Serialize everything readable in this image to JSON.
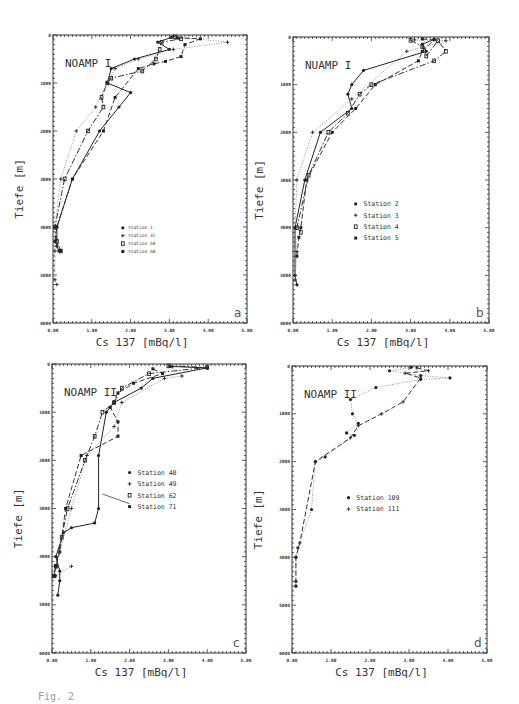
{
  "figure": {
    "caption": "Fig. 2",
    "y_axis_title": "Tiefe   [m]",
    "x_axis_title": "Cs 137    [mBq/l]"
  },
  "chart_data": [
    {
      "type": "line",
      "panel": "a",
      "title": "NOAMP I",
      "xlabel": "Cs 137 [mBq/l]",
      "ylabel": "Tiefe [m]",
      "xlim": [
        0,
        5
      ],
      "ylim": [
        6000,
        0
      ],
      "x_ticks": [
        "0.00",
        "1.00",
        "2.00",
        "3.00",
        "4.00",
        "5.00"
      ],
      "y_ticks": [
        "0",
        "1000",
        "2000",
        "3000",
        "4000",
        "5000",
        "6000"
      ],
      "grid": false,
      "legend_position": "center",
      "legend_font": 4.5,
      "box": {
        "x0": 53,
        "x1": 247,
        "y0": 35,
        "y1": 323
      },
      "series": [
        {
          "name": "Station 1",
          "marker": "*",
          "style": "solid",
          "points": [
            [
              3.05,
              50
            ],
            [
              2.7,
              150
            ],
            [
              3.0,
              300
            ],
            [
              2.1,
              500
            ],
            [
              1.5,
              700
            ],
            [
              1.4,
              1000
            ],
            [
              2.0,
              1200
            ],
            [
              1.7,
              1500
            ],
            [
              1.2,
              2000
            ],
            [
              0.5,
              3000
            ],
            [
              0.1,
              4000
            ],
            [
              0.1,
              4400
            ],
            [
              0.15,
              4500
            ]
          ]
        },
        {
          "name": "Station 31",
          "marker": "+",
          "style": "dotted",
          "points": [
            [
              3.1,
              30
            ],
            [
              4.5,
              150
            ],
            [
              3.1,
              300
            ],
            [
              2.2,
              500
            ],
            [
              1.6,
              700
            ],
            [
              1.4,
              1000
            ],
            [
              1.1,
              1500
            ],
            [
              0.6,
              2000
            ],
            [
              0.2,
              3000
            ],
            [
              0.05,
              4000
            ],
            [
              0.05,
              4500
            ],
            [
              0.05,
              5100
            ],
            [
              0.1,
              5200
            ]
          ]
        },
        {
          "name": "Station 54",
          "marker": "O",
          "style": "dash-dot",
          "points": [
            [
              3.15,
              40
            ],
            [
              3.3,
              80
            ],
            [
              2.8,
              150
            ],
            [
              2.75,
              300
            ],
            [
              2.65,
              500
            ],
            [
              2.3,
              750
            ],
            [
              1.5,
              900
            ],
            [
              1.4,
              1000
            ],
            [
              1.25,
              1300
            ],
            [
              1.3,
              1500
            ],
            [
              0.9,
              2000
            ],
            [
              0.3,
              3000
            ],
            [
              0.05,
              4000
            ],
            [
              0.1,
              4300
            ],
            [
              0.2,
              4500
            ]
          ]
        },
        {
          "name": "Station 58",
          "marker": "x",
          "style": "dashed",
          "points": [
            [
              3.2,
              60
            ],
            [
              3.8,
              80
            ],
            [
              3.4,
              200
            ],
            [
              3.3,
              450
            ],
            [
              2.9,
              550
            ],
            [
              2.6,
              600
            ],
            [
              2.2,
              700
            ],
            [
              1.6,
              1300
            ],
            [
              1.3,
              2000
            ],
            [
              0.5,
              3000
            ],
            [
              0.1,
              4000
            ],
            [
              0.05,
              4300
            ],
            [
              0.2,
              4500
            ]
          ]
        }
      ]
    },
    {
      "type": "line",
      "panel": "b",
      "title": "NUAMP I",
      "xlabel": "Cs 137 [mBq/l]",
      "ylabel": "Tiefe [m]",
      "xlim": [
        0,
        5
      ],
      "ylim": [
        6000,
        0
      ],
      "x_ticks": [
        "0.00",
        "1.00",
        "2.00",
        "3.00",
        "4.00",
        "5.00"
      ],
      "y_ticks": [
        "0",
        "1000",
        "2000",
        "3000",
        "4000",
        "5000",
        "6000"
      ],
      "grid": false,
      "legend_position": "center",
      "legend_font": 6.5,
      "box": {
        "x0": 293,
        "x1": 489,
        "y0": 37,
        "y1": 323
      },
      "series": [
        {
          "name": "Station 2",
          "marker": "*",
          "style": "solid",
          "points": [
            [
              3.6,
              50
            ],
            [
              3.3,
              150
            ],
            [
              3.4,
              300
            ],
            [
              1.8,
              700
            ],
            [
              1.5,
              1000
            ],
            [
              1.4,
              1200
            ],
            [
              1.5,
              1500
            ],
            [
              0.7,
              2000
            ],
            [
              0.3,
              3000
            ],
            [
              0.05,
              4000
            ],
            [
              0.05,
              5000
            ],
            [
              0.1,
              5200
            ]
          ]
        },
        {
          "name": "Station 3",
          "marker": "+",
          "style": "dotted",
          "points": [
            [
              3.1,
              60
            ],
            [
              3.9,
              80
            ],
            [
              2.9,
              300
            ],
            [
              1.5,
              1300
            ],
            [
              0.5,
              2000
            ],
            [
              0.1,
              3000
            ],
            [
              0.05,
              4000
            ],
            [
              0.1,
              4500
            ],
            [
              0.05,
              5100
            ]
          ]
        },
        {
          "name": "Station 4",
          "marker": "O",
          "style": "dash-dot",
          "points": [
            [
              3.0,
              70
            ],
            [
              3.3,
              200
            ],
            [
              3.4,
              400
            ],
            [
              3.7,
              80
            ],
            [
              3.9,
              300
            ],
            [
              3.6,
              500
            ],
            [
              2.0,
              1000
            ],
            [
              1.7,
              1200
            ],
            [
              1.4,
              1600
            ],
            [
              0.9,
              2000
            ],
            [
              0.4,
              2900
            ],
            [
              0.1,
              4000
            ],
            [
              0.2,
              4100
            ]
          ]
        },
        {
          "name": "Station 5",
          "marker": "x",
          "style": "dashed",
          "points": [
            [
              3.3,
              40
            ],
            [
              3.6,
              60
            ],
            [
              3.3,
              300
            ],
            [
              3.2,
              500
            ],
            [
              2.1,
              1000
            ],
            [
              1.6,
              1500
            ],
            [
              1.0,
              2000
            ],
            [
              0.35,
              3000
            ],
            [
              0.2,
              4000
            ],
            [
              0.15,
              4200
            ],
            [
              0.1,
              4600
            ]
          ]
        }
      ]
    },
    {
      "type": "line",
      "panel": "c",
      "title": "NOAMP II",
      "xlabel": "Cs 137 [mBq/l]",
      "ylabel": "Tiefe [m]",
      "xlim": [
        0,
        5
      ],
      "ylim": [
        6000,
        0
      ],
      "x_ticks": [
        "0.00",
        "1.00",
        "2.00",
        "3.00",
        "4.00",
        "5.00"
      ],
      "y_ticks": [
        "0",
        "1000",
        "2000",
        "3000",
        "4000",
        "5000",
        "6000"
      ],
      "grid": false,
      "legend_position": "center-right",
      "legend_font": 6.5,
      "box": {
        "x0": 52,
        "x1": 246,
        "y0": 364,
        "y1": 653
      },
      "annotation": {
        "text": "arrow pointing to Station 71 profile",
        "from": [
          2.0,
          2900
        ],
        "to": [
          1.25,
          2700
        ]
      },
      "series": [
        {
          "name": "Station 40",
          "marker": "*",
          "style": "solid",
          "points": [
            [
              3.05,
              50
            ],
            [
              4.0,
              80
            ],
            [
              2.6,
              300
            ],
            [
              2.3,
              500
            ],
            [
              1.6,
              800
            ],
            [
              1.4,
              1000
            ],
            [
              1.2,
              1900
            ],
            [
              1.2,
              3000
            ],
            [
              1.1,
              3300
            ],
            [
              0.5,
              3400
            ],
            [
              0.3,
              3500
            ],
            [
              0.1,
              4000
            ],
            [
              0.2,
              4300
            ],
            [
              0.2,
              4500
            ],
            [
              0.15,
              4800
            ]
          ]
        },
        {
          "name": "Station 49",
          "marker": "+",
          "style": "dotted",
          "points": [
            [
              3.1,
              60
            ],
            [
              3.35,
              250
            ],
            [
              2.9,
              300
            ],
            [
              1.8,
              800
            ],
            [
              1.6,
              1300
            ],
            [
              0.9,
              1900
            ],
            [
              0.5,
              3000
            ],
            [
              0.1,
              4200
            ],
            [
              0.1,
              4400
            ],
            [
              0.5,
              4200
            ]
          ]
        },
        {
          "name": "Station 62",
          "marker": "O",
          "style": "dash-dot",
          "points": [
            [
              3.0,
              40
            ],
            [
              4.0,
              70
            ],
            [
              2.5,
              200
            ],
            [
              1.8,
              500
            ],
            [
              1.6,
              800
            ],
            [
              1.3,
              1000
            ],
            [
              1.1,
              1500
            ],
            [
              0.85,
              2000
            ],
            [
              0.4,
              3000
            ],
            [
              0.25,
              3600
            ],
            [
              0.1,
              4200
            ],
            [
              0.05,
              4400
            ]
          ]
        },
        {
          "name": "Station 71",
          "marker": "x",
          "style": "dashed",
          "points": [
            [
              2.6,
              100
            ],
            [
              2.85,
              200
            ],
            [
              2.1,
              400
            ],
            [
              1.7,
              600
            ],
            [
              1.5,
              900
            ],
            [
              1.7,
              1200
            ],
            [
              1.7,
              1500
            ],
            [
              0.75,
              1900
            ],
            [
              0.35,
              3000
            ],
            [
              0.2,
              3900
            ],
            [
              0.1,
              4200
            ],
            [
              0.05,
              4400
            ]
          ]
        }
      ]
    },
    {
      "type": "line",
      "panel": "d",
      "title": "NOAMP II",
      "xlabel": "Cs 137 [mBq/l]",
      "ylabel": "Tiefe [m]",
      "xlim": [
        0,
        5
      ],
      "ylim": [
        6000,
        0
      ],
      "x_ticks": [
        "0.00",
        "1.00",
        "2.00",
        "3.00",
        "4.00",
        "5.00"
      ],
      "y_ticks": [
        "0",
        "1000",
        "2000",
        "3000",
        "4000",
        "5000",
        "6000"
      ],
      "grid": false,
      "legend_position": "center",
      "legend_font": 6.5,
      "box": {
        "x0": 292,
        "x1": 487,
        "y0": 366,
        "y1": 653
      },
      "series": [
        {
          "name": "Station 109",
          "marker": "*",
          "style": "dotted",
          "points": [
            [
              3.05,
              30
            ],
            [
              2.5,
              100
            ],
            [
              3.3,
              200
            ],
            [
              4.05,
              250
            ],
            [
              3.3,
              280
            ],
            [
              2.15,
              450
            ],
            [
              1.5,
              700
            ],
            [
              1.55,
              1000
            ],
            [
              1.7,
              1200
            ],
            [
              1.4,
              1400
            ],
            [
              1.6,
              1450
            ],
            [
              0.85,
              1900
            ],
            [
              0.6,
              2000
            ],
            [
              0.5,
              3000
            ],
            [
              0.15,
              3800
            ],
            [
              0.1,
              4000
            ],
            [
              0.1,
              4500
            ],
            [
              0.1,
              4600
            ]
          ]
        },
        {
          "name": "Station 111",
          "marker": "+",
          "style": "dashed",
          "points": [
            [
              3.2,
              40
            ],
            [
              3.5,
              100
            ],
            [
              2.9,
              150
            ],
            [
              3.3,
              250
            ],
            [
              2.85,
              750
            ],
            [
              2.3,
              1000
            ],
            [
              1.7,
              1250
            ],
            [
              1.5,
              1500
            ],
            [
              0.6,
              2000
            ],
            [
              0.2,
              3700
            ],
            [
              0.1,
              4000
            ],
            [
              0.1,
              4600
            ]
          ]
        }
      ]
    }
  ]
}
